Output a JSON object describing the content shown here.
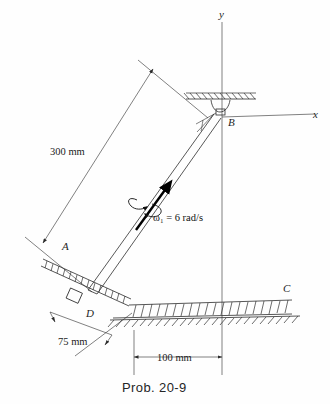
{
  "figure": {
    "caption": "Prob. 20-9",
    "type": "engineering-mechanics-kinematics-diagram",
    "faint_header_text": ""
  },
  "axes": {
    "y_label": "y",
    "x_label": "x",
    "origin_point": "B"
  },
  "points": {
    "A": "A",
    "B": "B",
    "C": "C",
    "D": "D"
  },
  "dimensions": [
    {
      "id": "rod-length",
      "label": "300 mm",
      "value": 300,
      "unit": "mm"
    },
    {
      "id": "incline-offset",
      "label": "75 mm",
      "value": 75,
      "unit": "mm"
    },
    {
      "id": "horizontal-offset",
      "label": "100 mm",
      "value": 100,
      "unit": "mm"
    }
  ],
  "annotations": {
    "angular_velocity": {
      "symbol": "ω",
      "subscript": "1",
      "equals": "=",
      "value": "6",
      "units": "rad/s",
      "full": "ω₁ = 6 rad/s"
    }
  },
  "colors": {
    "ink": "#2b2b2b",
    "bold_arrow": "#000000",
    "background": "#fefefe",
    "faint": "#d8d8d8"
  }
}
